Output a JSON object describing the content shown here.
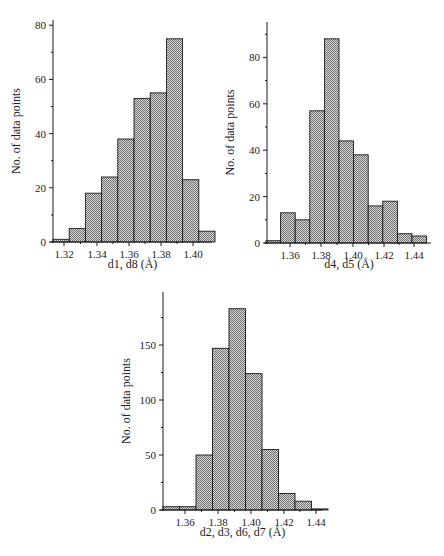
{
  "chart_data": [
    {
      "type": "bar",
      "id": "hist1",
      "title": "",
      "xlabel": "d1, d8 (Å)",
      "ylabel": "No. of data points",
      "ylim": [
        0,
        80
      ],
      "yticks": [
        0,
        20,
        40,
        60,
        80
      ],
      "xticks": [
        "1.32",
        "1.34",
        "1.36",
        "1.38",
        "1.40"
      ],
      "bin_width": 0.01,
      "categories": [
        "1.31",
        "1.32",
        "1.33",
        "1.34",
        "1.35",
        "1.36",
        "1.37",
        "1.38",
        "1.39",
        "1.40"
      ],
      "values": [
        1,
        5,
        18,
        24,
        38,
        53,
        55,
        75,
        23,
        4
      ],
      "grid": false,
      "legend": "none"
    },
    {
      "type": "bar",
      "id": "hist2",
      "title": "",
      "xlabel": "d4, d5 (Å)",
      "ylabel": "No. of data points",
      "ylim": [
        0,
        95
      ],
      "yticks": [
        0,
        20,
        40,
        60,
        80
      ],
      "xticks": [
        "1.36",
        "1.38",
        "1.40",
        "1.42",
        "1.44"
      ],
      "bin_width": 0.01,
      "categories": [
        "1.35",
        "1.36",
        "1.37",
        "1.38",
        "1.39",
        "1.40",
        "1.41",
        "1.42",
        "1.43",
        "1.44",
        "1.45"
      ],
      "values": [
        1,
        13,
        10,
        57,
        88,
        44,
        38,
        16,
        18,
        4,
        3
      ],
      "grid": false,
      "legend": "none"
    },
    {
      "type": "bar",
      "id": "hist3",
      "title": "",
      "xlabel": "d2, d3, d6, d7 (Å)",
      "ylabel": "No. of data points",
      "ylim": [
        0,
        198
      ],
      "yticks": [
        0,
        50,
        100,
        150
      ],
      "xticks": [
        "1.36",
        "1.38",
        "1.40",
        "1.42",
        "1.44"
      ],
      "bin_width": 0.01,
      "categories": [
        "1.35",
        "1.36",
        "1.37",
        "1.38",
        "1.39",
        "1.40",
        "1.41",
        "1.42",
        "1.43",
        "1.44"
      ],
      "values": [
        3,
        3,
        50,
        147,
        183,
        124,
        55,
        15,
        8,
        1
      ],
      "grid": false,
      "legend": "none"
    }
  ],
  "layout": [
    {
      "x0": 53,
      "y0": 242,
      "ytop": 20,
      "yscale": 2.71,
      "bar_x0": 53,
      "bar_w": 16.2,
      "axis_x_end": 212,
      "tick_x": [
        64,
        97,
        129,
        161,
        193
      ],
      "xlabel_y": 268
    },
    {
      "x0": 267,
      "y0": 243,
      "ytop": 22,
      "yscale": 2.32,
      "bar_x0": 266,
      "bar_w": 14.6,
      "axis_x_end": 431,
      "tick_x": [
        290,
        321,
        353,
        384,
        414
      ],
      "xlabel_y": 268
    },
    {
      "x0": 163,
      "y0": 510,
      "ytop": 292,
      "yscale": 1.1,
      "bar_x0": 163,
      "bar_w": 16.5,
      "axis_x_end": 322,
      "tick_x": [
        185,
        218,
        251,
        284,
        316
      ],
      "xlabel_y": 536
    }
  ],
  "colors": {
    "bar_fill_dark": "#6e6e6e",
    "bar_fill_light": "#d8d8d8",
    "bar_stroke": "#1a1a1a",
    "axis": "#1a1a1a"
  }
}
